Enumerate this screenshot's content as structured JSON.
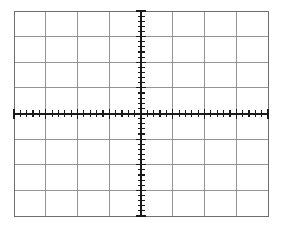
{
  "instrument": {
    "component_name": "oscilloscope-graticule",
    "display_type": "CRT graticule grid",
    "background_color": "#ffffff"
  },
  "graticule": {
    "divisions_horizontal": 8,
    "divisions_vertical": 8,
    "subdivisions_per_division": 5,
    "grid_line_color": "#7a7a7a",
    "grid_line_width": 0.8,
    "border_color": "#6e6e6e",
    "border_width": 1.0,
    "axis_color": "#1a1a1a",
    "axis_line_width": 2.0,
    "tick_color": "#1a1a1a",
    "tick_line_width": 1.2,
    "tick_length": 7,
    "plot_area": {
      "left": 14,
      "top": 11,
      "right": 268,
      "bottom": 216,
      "width": 254,
      "height": 205
    },
    "center": {
      "x": 141,
      "y": 113.5
    },
    "division_size": {
      "x": 31.75,
      "y": 25.625
    }
  },
  "chart_data": {
    "type": "line",
    "title": "",
    "xlabel": "",
    "ylabel": "",
    "xlim": [
      -4,
      4
    ],
    "ylim": [
      -4,
      4
    ],
    "x_tick_labels": [
      "-4",
      "-3",
      "-2",
      "-1",
      "0",
      "1",
      "2",
      "3",
      "4"
    ],
    "y_tick_labels": [
      "4",
      "3",
      "2",
      "1",
      "0",
      "-1",
      "-2",
      "-3",
      "-4"
    ],
    "grid": true,
    "legend": false,
    "series": [
      {
        "name": "trace",
        "x": [],
        "values": []
      }
    ],
    "annotations": []
  }
}
